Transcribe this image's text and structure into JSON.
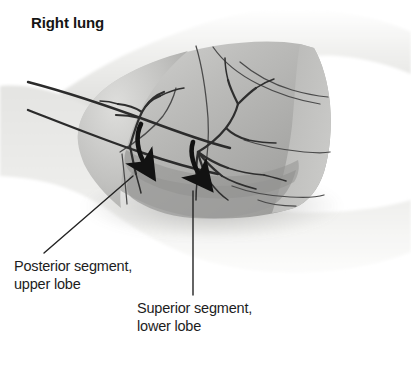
{
  "figure": {
    "title": "Right lung",
    "style": "grayscale-halftone-medical-illustration"
  },
  "labels": [
    {
      "id": "posterior-segment",
      "name": "label-posterior-segment-upper-lobe",
      "line1": "Posterior segment,",
      "line2": "upper lobe",
      "text": "Posterior segment,\nupper lobe",
      "leader": {
        "type": "diagonal-line",
        "from_x": 44,
        "from_y": 253,
        "to_x": 133,
        "to_y": 176
      }
    },
    {
      "id": "superior-segment",
      "name": "label-superior-segment-lower-lobe",
      "line1": "Superior segment,",
      "line2": "lower lobe",
      "text": "Superior segment,\nlower lobe",
      "leader": {
        "type": "vertical-line",
        "from_x": 193,
        "from_y": 295,
        "to_x": 193,
        "to_y": 191
      }
    }
  ],
  "arrows": [
    {
      "name": "arrow-posterior-segment",
      "direction": "down",
      "tip_x": 155,
      "tip_y": 183,
      "tail_x": 143,
      "tail_y": 126
    },
    {
      "name": "arrow-superior-segment",
      "direction": "down",
      "tip_x": 209,
      "tip_y": 190,
      "tail_x": 196,
      "tail_y": 146
    }
  ],
  "anatomy": {
    "lung_outline": "right lung lateral view with oblique and horizontal fissures",
    "bronchial_tree": "segmental bronchi branching from hilum",
    "probe_lines": 2,
    "thorax_contour": "shoulder and chest wall silhouette"
  },
  "colors": {
    "background": "#ffffff",
    "page_tint": "#fbfbfa",
    "body_light": "#e9e9e7",
    "body_mid": "#d6d6d4",
    "lung_light": "#c6c6c4",
    "lung_mid": "#b0b0ae",
    "lung_dark": "#9a9a98",
    "lung_darkest": "#868684",
    "line_stroke": "#3a3a3a",
    "arrow_fill": "#121212",
    "text": "#1d1d1d"
  }
}
